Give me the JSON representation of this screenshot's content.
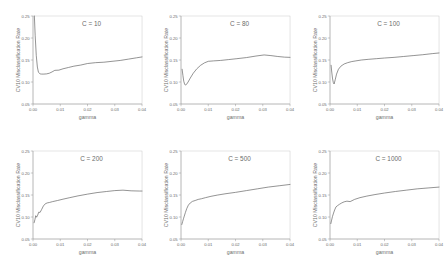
{
  "figure": {
    "type": "multi-panel-line",
    "rows": 2,
    "cols": 3,
    "background": "#ffffff",
    "line_color": "#5a5a5a",
    "frame_color": "#c9c9c9",
    "text_color": "#6b6b6b"
  },
  "axes": {
    "xlabel": "gamma",
    "ylabel": "CV10 Misclassification Rate",
    "xticks": [
      "0.00",
      "0.01",
      "0.02",
      "0.03",
      "0.04"
    ],
    "yticks": [
      "0.05",
      "0.10",
      "0.15",
      "0.20",
      "0.25"
    ],
    "xlim": [
      0.0,
      0.04
    ],
    "ylim": [
      0.05,
      0.25
    ],
    "grid": false,
    "legend": "none"
  },
  "chart_data": [
    {
      "type": "line",
      "title": "C = 10",
      "xlabel": "gamma",
      "ylabel": "CV10 Misclassification Rate",
      "xlim": [
        0.0,
        0.04
      ],
      "ylim": [
        0.05,
        0.25
      ],
      "xticks": [
        "0.00",
        "0.01",
        "0.02",
        "0.03",
        "0.04"
      ],
      "yticks": [
        "0.05",
        "0.10",
        "0.15",
        "0.20",
        "0.25"
      ],
      "x": [
        0.0005,
        0.0008,
        0.0012,
        0.0016,
        0.002,
        0.0026,
        0.0032,
        0.004,
        0.005,
        0.006,
        0.007,
        0.008,
        0.0095,
        0.011,
        0.013,
        0.015,
        0.0175,
        0.02,
        0.023,
        0.026,
        0.029,
        0.032,
        0.035,
        0.038,
        0.04
      ],
      "y": [
        0.25,
        0.205,
        0.16,
        0.134,
        0.122,
        0.1185,
        0.118,
        0.118,
        0.1185,
        0.12,
        0.123,
        0.1265,
        0.127,
        0.13,
        0.133,
        0.136,
        0.1385,
        0.142,
        0.144,
        0.145,
        0.147,
        0.149,
        0.152,
        0.155,
        0.157
      ]
    },
    {
      "type": "line",
      "title": "C = 80",
      "xlabel": "gamma",
      "ylabel": "CV10 Misclassification Rate",
      "xlim": [
        0.0,
        0.04
      ],
      "ylim": [
        0.05,
        0.25
      ],
      "xticks": [
        "0.00",
        "0.01",
        "0.02",
        "0.03",
        "0.04"
      ],
      "yticks": [
        "0.05",
        "0.10",
        "0.15",
        "0.20",
        "0.25"
      ],
      "x": [
        0.0004,
        0.0007,
        0.001,
        0.0013,
        0.0016,
        0.002,
        0.0026,
        0.0034,
        0.0045,
        0.0058,
        0.0072,
        0.0086,
        0.01,
        0.012,
        0.0145,
        0.0175,
        0.0205,
        0.024,
        0.0275,
        0.0305,
        0.033,
        0.0355,
        0.038,
        0.04
      ],
      "y": [
        0.129,
        0.115,
        0.102,
        0.0955,
        0.093,
        0.0945,
        0.1,
        0.109,
        0.12,
        0.13,
        0.138,
        0.1435,
        0.147,
        0.148,
        0.149,
        0.151,
        0.153,
        0.1555,
        0.159,
        0.1615,
        0.16,
        0.158,
        0.1565,
        0.156
      ]
    },
    {
      "type": "line",
      "title": "C = 100",
      "xlabel": "gamma",
      "ylabel": "CV10 Misclassification Rate",
      "xlim": [
        0.0,
        0.04
      ],
      "ylim": [
        0.05,
        0.25
      ],
      "xticks": [
        "0.00",
        "0.01",
        "0.02",
        "0.03",
        "0.04"
      ],
      "yticks": [
        "0.05",
        "0.10",
        "0.15",
        "0.20",
        "0.25"
      ],
      "x": [
        0.0004,
        0.0006,
        0.0009,
        0.0012,
        0.0015,
        0.0019,
        0.0024,
        0.0031,
        0.004,
        0.0052,
        0.0065,
        0.008,
        0.0095,
        0.0115,
        0.014,
        0.017,
        0.02,
        0.0235,
        0.027,
        0.0305,
        0.034,
        0.0375,
        0.04
      ],
      "y": [
        0.138,
        0.125,
        0.109,
        0.099,
        0.0955,
        0.105,
        0.118,
        0.129,
        0.136,
        0.141,
        0.144,
        0.1465,
        0.148,
        0.15,
        0.1515,
        0.153,
        0.1545,
        0.156,
        0.158,
        0.16,
        0.162,
        0.1645,
        0.166
      ]
    },
    {
      "type": "line",
      "title": "C = 200",
      "xlabel": "gamma",
      "ylabel": "CV10 Misclassification Rate",
      "xlim": [
        0.0,
        0.04
      ],
      "ylim": [
        0.05,
        0.25
      ],
      "xticks": [
        "0.00",
        "0.01",
        "0.02",
        "0.03",
        "0.04"
      ],
      "yticks": [
        "0.05",
        "0.10",
        "0.15",
        "0.20",
        "0.25"
      ],
      "x": [
        0.0004,
        0.0007,
        0.001,
        0.0013,
        0.0017,
        0.0021,
        0.0026,
        0.0032,
        0.0038,
        0.0045,
        0.0052,
        0.006,
        0.0072,
        0.009,
        0.011,
        0.0135,
        0.0165,
        0.02,
        0.0235,
        0.027,
        0.03,
        0.033,
        0.036,
        0.039,
        0.04
      ],
      "y": [
        0.087,
        0.094,
        0.103,
        0.0995,
        0.104,
        0.111,
        0.1105,
        0.1175,
        0.125,
        0.13,
        0.132,
        0.133,
        0.135,
        0.1375,
        0.1405,
        0.144,
        0.148,
        0.152,
        0.1555,
        0.158,
        0.16,
        0.161,
        0.1595,
        0.159,
        0.159
      ]
    },
    {
      "type": "line",
      "title": "C = 500",
      "xlabel": "gamma",
      "ylabel": "CV10 Misclassification Rate",
      "xlim": [
        0.0,
        0.04
      ],
      "ylim": [
        0.05,
        0.25
      ],
      "xticks": [
        "0.00",
        "0.01",
        "0.02",
        "0.03",
        "0.04"
      ],
      "yticks": [
        "0.05",
        "0.10",
        "0.15",
        "0.20",
        "0.25"
      ],
      "x": [
        0.0003,
        0.0006,
        0.0009,
        0.0012,
        0.0016,
        0.0021,
        0.0027,
        0.0034,
        0.0042,
        0.0052,
        0.0063,
        0.0075,
        0.009,
        0.011,
        0.0135,
        0.0165,
        0.02,
        0.024,
        0.028,
        0.032,
        0.036,
        0.04
      ],
      "y": [
        0.083,
        0.0895,
        0.096,
        0.102,
        0.11,
        0.119,
        0.127,
        0.132,
        0.1355,
        0.1375,
        0.14,
        0.1415,
        0.144,
        0.147,
        0.15,
        0.153,
        0.156,
        0.16,
        0.164,
        0.168,
        0.171,
        0.174
      ]
    },
    {
      "type": "line",
      "title": "C = 1000",
      "xlabel": "gamma",
      "ylabel": "CV10 Misclassification Rate",
      "xlim": [
        0.0,
        0.04
      ],
      "ylim": [
        0.05,
        0.25
      ],
      "xticks": [
        "0.00",
        "0.01",
        "0.02",
        "0.03",
        "0.04"
      ],
      "yticks": [
        "0.05",
        "0.10",
        "0.15",
        "0.20",
        "0.25"
      ],
      "x": [
        0.0003,
        0.0006,
        0.0009,
        0.0013,
        0.0017,
        0.0022,
        0.0028,
        0.0035,
        0.0043,
        0.0052,
        0.0062,
        0.0074,
        0.009,
        0.011,
        0.0135,
        0.0165,
        0.02,
        0.024,
        0.028,
        0.032,
        0.036,
        0.04
      ],
      "y": [
        0.085,
        0.093,
        0.101,
        0.109,
        0.116,
        0.123,
        0.126,
        0.129,
        0.132,
        0.1345,
        0.136,
        0.135,
        0.14,
        0.144,
        0.1475,
        0.151,
        0.1545,
        0.158,
        0.161,
        0.164,
        0.166,
        0.168
      ]
    }
  ]
}
